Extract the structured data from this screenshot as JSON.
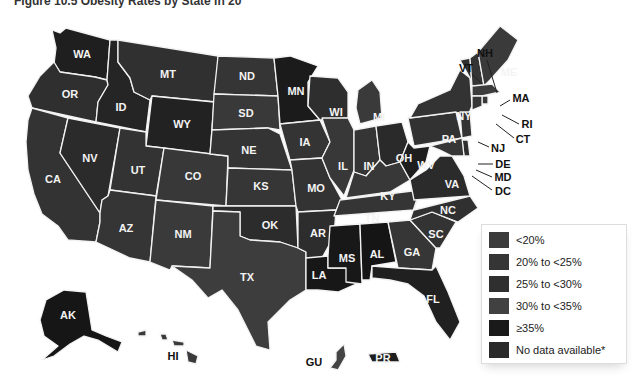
{
  "title": "Figure 10.5 Obesity Rates by State in 20",
  "colors": {
    "lt20": "#3b3b3b",
    "20to25": "#353535",
    "25to30": "#2f2f2f",
    "30to35": "#414141",
    "ge35": "#1a1a1a",
    "nodata": "#2a2a2a",
    "border": "#f2f2f2"
  },
  "legend": {
    "items": [
      {
        "label": "<20%",
        "key": "lt20"
      },
      {
        "label": "20% to <25%",
        "key": "20to25"
      },
      {
        "label": "25% to <30%",
        "key": "25to30"
      },
      {
        "label": "30% to <35%",
        "key": "30to35"
      },
      {
        "label": "≥35%",
        "key": "ge35"
      },
      {
        "label": "No data available*",
        "key": "nodata"
      }
    ]
  },
  "states": {
    "WA": "WA",
    "OR": "OR",
    "CA": "CA",
    "ID": "ID",
    "NV": "NV",
    "MT": "MT",
    "WY": "WY",
    "UT": "UT",
    "AZ": "AZ",
    "CO": "CO",
    "NM": "NM",
    "ND": "ND",
    "SD": "SD",
    "NE": "NE",
    "KS": "KS",
    "OK": "OK",
    "TX": "TX",
    "MN": "MN",
    "IA": "IA",
    "MO": "MO",
    "AR": "AR",
    "LA": "LA",
    "WI": "WI",
    "IL": "IL",
    "MI": "MI",
    "IN": "IN",
    "OH": "OH",
    "KY": "KY",
    "TN": "TN",
    "MS": "MS",
    "AL": "AL",
    "GA": "GA",
    "FL": "FL",
    "SC": "SC",
    "NC": "NC",
    "VA": "VA",
    "WV": "WV",
    "PA": "PA",
    "NY": "NY",
    "VT": "VT",
    "NH": "NH",
    "ME": "ME",
    "MA": "MA",
    "RI": "RI",
    "CT": "CT",
    "NJ": "NJ",
    "DE": "DE",
    "MD": "MD",
    "DC": "DC",
    "AK": "AK",
    "HI": "HI",
    "GU": "GU",
    "PR": "PR"
  }
}
